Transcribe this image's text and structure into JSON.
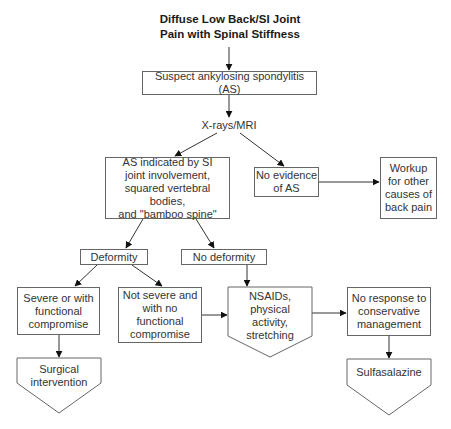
{
  "diagram": {
    "title_line1": "Diffuse Low Back/SI Joint",
    "title_line2": "Pain with Spinal Stiffness",
    "nodes": {
      "suspect_as": "Suspect ankylosing spondylitis (AS)",
      "imaging": "X-rays/MRI",
      "as_indicated": "AS indicated by SI\njoint involvement,\nsquared vertebral bodies,\nand \"bamboo spine\"",
      "no_evidence": "No evidence\nof AS",
      "workup": "Workup\nfor other\ncauses of\nback pain",
      "deformity": "Deformity",
      "no_deformity": "No deformity",
      "severe": "Severe or with\nfunctional\ncompromise",
      "not_severe": "Not severe and\nwith no\nfunctional\ncompromise",
      "nsaids": "NSAIDs,\nphysical\nactivity,\nstretching",
      "no_response": "No response to\nconservative\nmanagement",
      "surgical": "Surgical\nintervention",
      "sulfasalazine": "Sulfasalazine"
    },
    "edges": [
      {
        "from": "title",
        "to": "suspect_as"
      },
      {
        "from": "suspect_as",
        "to": "imaging"
      },
      {
        "from": "imaging",
        "to": "as_indicated"
      },
      {
        "from": "imaging",
        "to": "no_evidence"
      },
      {
        "from": "no_evidence",
        "to": "workup"
      },
      {
        "from": "as_indicated",
        "to": "deformity"
      },
      {
        "from": "as_indicated",
        "to": "no_deformity"
      },
      {
        "from": "deformity",
        "to": "severe"
      },
      {
        "from": "deformity",
        "to": "not_severe"
      },
      {
        "from": "severe",
        "to": "surgical"
      },
      {
        "from": "not_severe",
        "to": "nsaids"
      },
      {
        "from": "no_deformity",
        "to": "nsaids"
      },
      {
        "from": "nsaids",
        "to": "no_response"
      },
      {
        "from": "no_response",
        "to": "sulfasalazine"
      }
    ],
    "colors": {
      "line": "#333333",
      "border": "#666666",
      "text": "#333333"
    }
  }
}
